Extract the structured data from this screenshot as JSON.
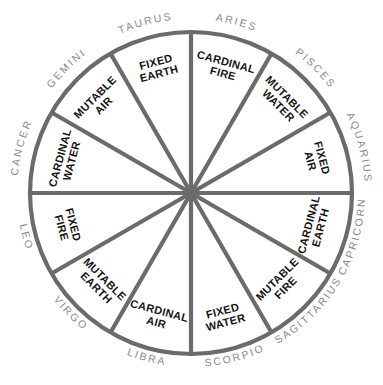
{
  "diagram": {
    "geometry": {
      "center_x": 191,
      "center_y": 193,
      "radius": 161,
      "sector_count": 12,
      "sector_degrees": 30
    },
    "colors": {
      "background": "#ffffff",
      "line": "#6b6b6b",
      "outer_label": "#8a8a8a",
      "inner_label": "#141414"
    },
    "signs": [
      {
        "name": "ARIES",
        "quality": "CARDINAL",
        "element": "FIRE",
        "mid_angle": -75
      },
      {
        "name": "TAURUS",
        "quality": "FIXED",
        "element": "EARTH",
        "mid_angle": -105
      },
      {
        "name": "GEMINI",
        "quality": "MUTABLE",
        "element": "AIR",
        "mid_angle": -135
      },
      {
        "name": "CANCER",
        "quality": "CARDINAL",
        "element": "WATER",
        "mid_angle": -165
      },
      {
        "name": "LEO",
        "quality": "FIXED",
        "element": "FIRE",
        "mid_angle": 165
      },
      {
        "name": "VIRGO",
        "quality": "MUTABLE",
        "element": "EARTH",
        "mid_angle": 135
      },
      {
        "name": "LIBRA",
        "quality": "CARDINAL",
        "element": "AIR",
        "mid_angle": 105
      },
      {
        "name": "SCORPIO",
        "quality": "FIXED",
        "element": "WATER",
        "mid_angle": 75
      },
      {
        "name": "SAGITTARIUS",
        "quality": "MUTABLE",
        "element": "FIRE",
        "mid_angle": 45
      },
      {
        "name": "CAPRICORN",
        "quality": "CARDINAL",
        "element": "EARTH",
        "mid_angle": 15
      },
      {
        "name": "AQUARIUS",
        "quality": "FIXED",
        "element": "AIR",
        "mid_angle": -15
      },
      {
        "name": "PISCES",
        "quality": "MUTABLE",
        "element": "WATER",
        "mid_angle": -45
      }
    ]
  }
}
